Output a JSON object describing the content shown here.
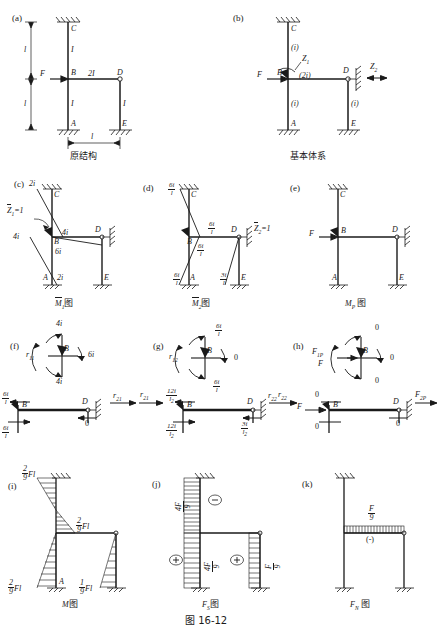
{
  "figure": {
    "caption": "图 16-12",
    "panels": [
      {
        "key": "a",
        "letter": "(a)",
        "title": "原结构",
        "joints": [
          "C",
          "F",
          "B",
          "D",
          "A",
          "E"
        ],
        "member_labels": [
          "I",
          "2I",
          "I",
          "I"
        ],
        "dimension_labels": [
          "l",
          "l",
          "l"
        ],
        "load_label": "F"
      },
      {
        "key": "b",
        "letter": "(b)",
        "title": "基本体系",
        "joints": [
          "C",
          "B",
          "D",
          "A",
          "E"
        ],
        "stiffness_labels": [
          "(i)",
          "(2i)",
          "(i)",
          "(i)"
        ],
        "unknowns": [
          "Z1",
          "Z2"
        ],
        "load_label": "F"
      },
      {
        "key": "c",
        "letter": "(c)",
        "title": "M1图",
        "title_sub": "1",
        "unit_label": "Z1=1",
        "values": [
          "2i",
          "4i",
          "4i",
          "6i",
          "2i"
        ],
        "joints": [
          "C",
          "B",
          "D",
          "A",
          "E"
        ]
      },
      {
        "key": "d",
        "letter": "(d)",
        "title": "M2图",
        "title_sub": "2",
        "unit_label": "Z2=1",
        "values": [
          "6i/l",
          "6i/l",
          "6i/l",
          "6i/l",
          "3i/l"
        ],
        "joints": [
          "C",
          "B",
          "D",
          "A",
          "E"
        ]
      },
      {
        "key": "e",
        "letter": "(e)",
        "title": "MP 图",
        "title_sub": "P",
        "load_label": "F",
        "joints": [
          "C",
          "B",
          "D",
          "A",
          "E"
        ]
      },
      {
        "key": "f",
        "letter": "(f)",
        "coefficient": "r11",
        "node": "B",
        "moment_values": [
          "4i",
          "6i",
          "4i"
        ],
        "shear_coefficient": "r21",
        "shear_values": [
          "6i/l",
          "6i/l",
          "0"
        ],
        "shear_nodes": [
          "B",
          "D"
        ]
      },
      {
        "key": "g",
        "letter": "(g)",
        "coefficient": "r12",
        "node": "B",
        "moment_values": [
          "6i/l",
          "0",
          "6i/l"
        ],
        "shear_coefficient_in": "r21",
        "shear_coefficient": "r22",
        "shear_values": [
          "12i/l²",
          "12i/l²",
          "3i/l²"
        ],
        "shear_nodes": [
          "B",
          "D"
        ]
      },
      {
        "key": "h",
        "letter": "(h)",
        "coefficient": "F1P",
        "node": "B",
        "load_label": "F",
        "moment_values": [
          "0",
          "0",
          "0"
        ],
        "shear_coefficient_in": "r22",
        "shear_coefficient": "F2P",
        "shear_values": [
          "0",
          "0",
          "0"
        ],
        "shear_nodes": [
          "B",
          "D"
        ],
        "shear_load_label": "F"
      },
      {
        "key": "i",
        "letter": "(i)",
        "title": "M图",
        "values": [
          "2/9 Fl",
          "2/9 Fl",
          "2/9 Fl",
          "1/9 Fl"
        ],
        "joints": [
          "A"
        ]
      },
      {
        "key": "j",
        "letter": "(j)",
        "title": "FS图",
        "title_sub": "S",
        "values": [
          "4F/9",
          "4F/9",
          "F/9"
        ],
        "signs": [
          "(-)",
          "(+)",
          "(+)"
        ]
      },
      {
        "key": "k",
        "letter": "(k)",
        "title": "FN图",
        "title_sub": "N",
        "values": [
          "F/9"
        ],
        "signs": [
          "(-)"
        ]
      }
    ]
  },
  "symbols": {
    "numerator_2": "2",
    "denominator_9": "9",
    "numerator_1": "1",
    "numerator_4F": "4F",
    "numerator_F": "F",
    "numerator_6i": "6i",
    "numerator_12i": "12i",
    "numerator_3i": "3i",
    "denominator_l": "l",
    "Fl": "Fl",
    "i_2": "2i",
    "i_4": "4i",
    "i_6": "6i",
    "zero": "0",
    "plus": "(+)",
    "minus": "(−)"
  }
}
